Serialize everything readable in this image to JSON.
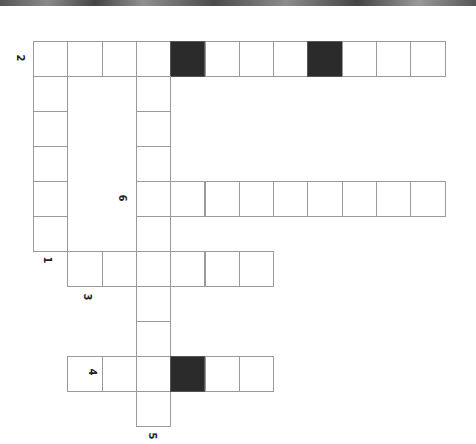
{
  "puzzle": {
    "type": "crossword",
    "cell_size": [
      34.3,
      35
    ],
    "origin": [
      33,
      41
    ],
    "cols": 12,
    "rows": 12,
    "cells": [
      {
        "r": 0,
        "c": 0
      },
      {
        "r": 0,
        "c": 1
      },
      {
        "r": 0,
        "c": 2
      },
      {
        "r": 0,
        "c": 3
      },
      {
        "r": 0,
        "c": 4,
        "black": true
      },
      {
        "r": 0,
        "c": 5
      },
      {
        "r": 0,
        "c": 6
      },
      {
        "r": 0,
        "c": 7
      },
      {
        "r": 0,
        "c": 8,
        "black": true
      },
      {
        "r": 0,
        "c": 9
      },
      {
        "r": 0,
        "c": 10
      },
      {
        "r": 0,
        "c": 11
      },
      {
        "r": 1,
        "c": 0
      },
      {
        "r": 2,
        "c": 0
      },
      {
        "r": 3,
        "c": 0
      },
      {
        "r": 4,
        "c": 0
      },
      {
        "r": 5,
        "c": 0
      },
      {
        "r": 1,
        "c": 3
      },
      {
        "r": 2,
        "c": 3
      },
      {
        "r": 3,
        "c": 3
      },
      {
        "r": 4,
        "c": 3
      },
      {
        "r": 5,
        "c": 3
      },
      {
        "r": 6,
        "c": 3
      },
      {
        "r": 7,
        "c": 3
      },
      {
        "r": 8,
        "c": 3
      },
      {
        "r": 9,
        "c": 3
      },
      {
        "r": 10,
        "c": 3
      },
      {
        "r": 4,
        "c": 4
      },
      {
        "r": 4,
        "c": 5
      },
      {
        "r": 4,
        "c": 6
      },
      {
        "r": 4,
        "c": 7
      },
      {
        "r": 4,
        "c": 8
      },
      {
        "r": 4,
        "c": 9
      },
      {
        "r": 4,
        "c": 10
      },
      {
        "r": 4,
        "c": 11
      },
      {
        "r": 6,
        "c": 1
      },
      {
        "r": 6,
        "c": 2
      },
      {
        "r": 6,
        "c": 4
      },
      {
        "r": 6,
        "c": 5
      },
      {
        "r": 6,
        "c": 6
      },
      {
        "r": 9,
        "c": 1
      },
      {
        "r": 9,
        "c": 2
      },
      {
        "r": 9,
        "c": 4,
        "black": true
      },
      {
        "r": 9,
        "c": 5
      },
      {
        "r": 9,
        "c": 6
      }
    ],
    "labels": [
      {
        "text": "2",
        "x": 15,
        "y": 53
      },
      {
        "text": "6",
        "x": 117,
        "y": 193
      },
      {
        "text": "1",
        "x": 42,
        "y": 255
      },
      {
        "text": "3",
        "x": 82,
        "y": 292
      },
      {
        "text": "4",
        "x": 87,
        "y": 367
      },
      {
        "text": "5",
        "x": 147,
        "y": 431
      }
    ]
  }
}
